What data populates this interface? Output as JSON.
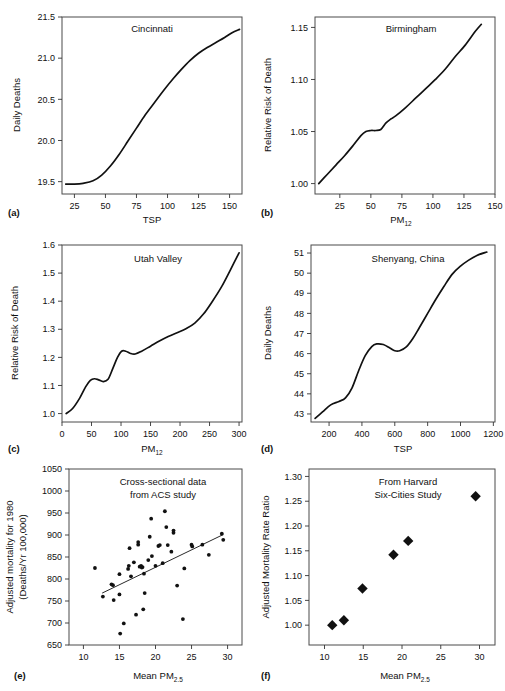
{
  "figure": {
    "panel_letters": [
      "(a)",
      "(b)",
      "(c)",
      "(d)",
      "(e)",
      "(f)"
    ]
  },
  "chart_data": [
    {
      "panel": "(a)",
      "type": "line",
      "title": "Cincinnati",
      "xlabel": "TSP",
      "ylabel": "Daily Deaths",
      "xlim": [
        15,
        160
      ],
      "ylim": [
        19.35,
        21.5
      ],
      "xticks": [
        25,
        50,
        75,
        100,
        125,
        150
      ],
      "yticks": [
        19.5,
        20.0,
        20.5,
        21.0,
        21.5
      ],
      "ytick_labels": [
        "19.5",
        "20.0",
        "20.5",
        "21.0",
        "21.5"
      ],
      "grid": false,
      "legend": "none",
      "x": [
        18,
        25,
        32,
        40,
        47,
        54,
        61,
        68,
        75,
        82,
        90,
        97,
        104,
        111,
        118,
        125,
        132,
        139,
        146,
        152,
        158
      ],
      "y": [
        19.47,
        19.47,
        19.48,
        19.51,
        19.58,
        19.69,
        19.83,
        19.99,
        20.15,
        20.31,
        20.47,
        20.61,
        20.74,
        20.86,
        20.97,
        21.06,
        21.13,
        21.19,
        21.25,
        21.31,
        21.35
      ]
    },
    {
      "panel": "(b)",
      "type": "line",
      "title": "Birmingham",
      "xlabel": "PM",
      "xlabel_sub": "12",
      "ylabel": "Relative Risk of Death",
      "xlim": [
        5,
        150
      ],
      "ylim": [
        0.99,
        1.16
      ],
      "xticks": [
        25,
        50,
        75,
        100,
        125,
        150
      ],
      "yticks": [
        1.0,
        1.05,
        1.1,
        1.15
      ],
      "ytick_labels": [
        "1.00",
        "1.05",
        "1.10",
        "1.15"
      ],
      "grid": false,
      "legend": "none",
      "x": [
        8,
        15,
        22,
        29,
        36,
        42,
        46,
        50,
        54,
        58,
        62,
        66,
        70,
        78,
        86,
        94,
        102,
        110,
        118,
        126,
        134,
        139
      ],
      "y": [
        1.0,
        1.009,
        1.018,
        1.027,
        1.037,
        1.046,
        1.05,
        1.051,
        1.051,
        1.052,
        1.058,
        1.062,
        1.065,
        1.073,
        1.082,
        1.091,
        1.1,
        1.11,
        1.122,
        1.133,
        1.146,
        1.153
      ]
    },
    {
      "panel": "(c)",
      "type": "line",
      "title": "Utah Valley",
      "xlabel": "PM",
      "xlabel_sub": "12",
      "ylabel": "Relative Risk of Death",
      "xlim": [
        0,
        305
      ],
      "ylim": [
        0.97,
        1.6
      ],
      "xticks": [
        0,
        50,
        100,
        150,
        200,
        250,
        300
      ],
      "yticks": [
        1.0,
        1.1,
        1.2,
        1.3,
        1.4,
        1.5,
        1.6
      ],
      "ytick_labels": [
        "1.0",
        "1.1",
        "1.2",
        "1.3",
        "1.4",
        "1.5",
        "1.6"
      ],
      "grid": false,
      "legend": "none",
      "x": [
        7,
        18,
        30,
        40,
        48,
        55,
        62,
        70,
        78,
        86,
        94,
        101,
        108,
        116,
        124,
        135,
        150,
        165,
        180,
        195,
        210,
        225,
        240,
        255,
        270,
        285,
        300
      ],
      "y": [
        1.0,
        1.018,
        1.055,
        1.095,
        1.118,
        1.124,
        1.12,
        1.114,
        1.122,
        1.16,
        1.2,
        1.222,
        1.222,
        1.214,
        1.212,
        1.222,
        1.24,
        1.258,
        1.274,
        1.288,
        1.302,
        1.322,
        1.355,
        1.4,
        1.45,
        1.51,
        1.572
      ]
    },
    {
      "panel": "(d)",
      "type": "line",
      "title": "Shenyang, China",
      "xlabel": "TSP",
      "ylabel": "Daily Deaths",
      "xlim": [
        90,
        1210
      ],
      "ylim": [
        42.6,
        51.4
      ],
      "xticks": [
        200,
        400,
        600,
        800,
        1000,
        1200
      ],
      "yticks": [
        43,
        44,
        45,
        46,
        47,
        48,
        49,
        50,
        51
      ],
      "ytick_labels": [
        "43",
        "44",
        "45",
        "46",
        "47",
        "48",
        "49",
        "50",
        "51"
      ],
      "grid": false,
      "legend": "none",
      "x": [
        115,
        160,
        210,
        260,
        300,
        340,
        380,
        420,
        460,
        490,
        530,
        570,
        600,
        630,
        670,
        710,
        750,
        800,
        850,
        900,
        950,
        1000,
        1050,
        1100,
        1160
      ],
      "y": [
        42.78,
        43.1,
        43.45,
        43.62,
        43.8,
        44.3,
        45.15,
        45.9,
        46.35,
        46.48,
        46.45,
        46.28,
        46.14,
        46.14,
        46.33,
        46.75,
        47.3,
        48.0,
        48.7,
        49.35,
        49.95,
        50.35,
        50.65,
        50.88,
        51.05
      ]
    },
    {
      "panel": "(e)",
      "type": "scatter",
      "title_line1": "Cross-sectional data",
      "title_line2": "from ACS study",
      "xlabel": "Mean PM",
      "xlabel_sub": "2.5",
      "ylabel_line1": "Adjusted mortality for 1980",
      "ylabel_line2": "(Deaths/Yr 100,000)",
      "xlim": [
        8,
        32
      ],
      "ylim": [
        650,
        1050
      ],
      "xticks": [
        10,
        15,
        20,
        25,
        30
      ],
      "yticks": [
        650,
        700,
        750,
        800,
        850,
        900,
        950,
        1000,
        1050
      ],
      "ytick_labels": [
        "650",
        "700",
        "750",
        "800",
        "850",
        "900",
        "950",
        "1000",
        "1050"
      ],
      "grid": false,
      "legend": "none",
      "points": [
        [
          11.6,
          825
        ],
        [
          12.7,
          760
        ],
        [
          13.9,
          788
        ],
        [
          14.1,
          786
        ],
        [
          14.2,
          752
        ],
        [
          15.0,
          811
        ],
        [
          15.0,
          765
        ],
        [
          15.1,
          676
        ],
        [
          15.6,
          699
        ],
        [
          16.2,
          823
        ],
        [
          16.3,
          830
        ],
        [
          16.4,
          870
        ],
        [
          16.6,
          806
        ],
        [
          17.0,
          838
        ],
        [
          17.3,
          719
        ],
        [
          17.6,
          878
        ],
        [
          17.6,
          884
        ],
        [
          17.8,
          828
        ],
        [
          18.0,
          830
        ],
        [
          18.1,
          826
        ],
        [
          18.2,
          827
        ],
        [
          18.3,
          731
        ],
        [
          18.4,
          812
        ],
        [
          18.5,
          768
        ],
        [
          19.0,
          843
        ],
        [
          19.2,
          896
        ],
        [
          19.4,
          937
        ],
        [
          19.5,
          852
        ],
        [
          20.0,
          830
        ],
        [
          20.4,
          875
        ],
        [
          20.6,
          877
        ],
        [
          21.0,
          836
        ],
        [
          21.3,
          954
        ],
        [
          21.5,
          918
        ],
        [
          21.7,
          877
        ],
        [
          22.2,
          862
        ],
        [
          22.5,
          910
        ],
        [
          22.5,
          905
        ],
        [
          23.0,
          785
        ],
        [
          23.8,
          709
        ],
        [
          24.0,
          824
        ],
        [
          25.0,
          878
        ],
        [
          25.1,
          874
        ],
        [
          26.5,
          878
        ],
        [
          27.4,
          855
        ],
        [
          29.2,
          903
        ],
        [
          29.4,
          889
        ]
      ],
      "regression_line": {
        "x": [
          12.6,
          29.4
        ],
        "y": [
          768,
          901
        ]
      }
    },
    {
      "panel": "(f)",
      "type": "scatter",
      "title_line1": "From Harvard",
      "title_line2": "Six-Cities Study",
      "xlabel": "Mean PM",
      "xlabel_sub": "2.5",
      "ylabel": "Adjusted Mortality Rate Ratio",
      "xlim": [
        8,
        32
      ],
      "ylim": [
        0.96,
        1.315
      ],
      "xticks": [
        10,
        15,
        20,
        25,
        30
      ],
      "yticks": [
        1.0,
        1.05,
        1.1,
        1.15,
        1.2,
        1.25,
        1.3
      ],
      "ytick_labels": [
        "1.00",
        "1.05",
        "1.10",
        "1.15",
        "1.20",
        "1.25",
        "1.30"
      ],
      "grid": false,
      "legend": "none",
      "points": [
        [
          11.0,
          1.0
        ],
        [
          12.5,
          1.01
        ],
        [
          14.9,
          1.074
        ],
        [
          18.9,
          1.142
        ],
        [
          20.8,
          1.17
        ],
        [
          29.5,
          1.26
        ]
      ]
    }
  ]
}
